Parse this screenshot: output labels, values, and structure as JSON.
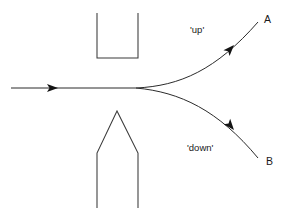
{
  "figure": {
    "type": "diagram",
    "background_color": "#ffffff",
    "line_color": "#3a3a3a",
    "text_color": "#1a1a1a",
    "width": 286,
    "height": 217
  },
  "labels": {
    "up": "'up'",
    "down": "'down'",
    "beam_a": "A",
    "beam_b": "B"
  },
  "label_positions": {
    "up": {
      "x": 190,
      "y": 33
    },
    "down": {
      "x": 187,
      "y": 151
    },
    "beam_a": {
      "x": 264,
      "y": 23
    },
    "beam_b": {
      "x": 266,
      "y": 165
    }
  },
  "shapes": {
    "top_magnet": {
      "name": "top-pole-piece",
      "description": "U-shaped bracket opening upward",
      "points": "97,13 97,58 138,58 138,13"
    },
    "bottom_magnet": {
      "name": "bottom-pole-piece",
      "description": "house shape with upward apex",
      "points": "97,208 97,153 117,111 138,153 138,208"
    }
  },
  "beams": {
    "incoming": {
      "name": "incoming-beam",
      "start_x": 11,
      "end_x": 136,
      "y": 88,
      "arrow_tip_x": 58,
      "arrow_tail_x": 47
    },
    "upper": {
      "name": "upper-beam-path",
      "path": "M136,88 C180,86 216,70 258,22",
      "arrow_at": {
        "x": 231,
        "y": 48,
        "angle": -47
      }
    },
    "lower": {
      "name": "lower-beam-path",
      "path": "M136,88 C180,92 218,110 258,158",
      "arrow_at": {
        "x": 231,
        "y": 127,
        "angle": 50
      }
    }
  }
}
